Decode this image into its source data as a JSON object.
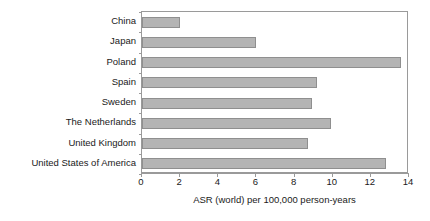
{
  "chart_data": {
    "type": "bar",
    "orientation": "horizontal",
    "title": "",
    "xlabel": "ASR (world) per 100,000 person-years",
    "ylabel": "",
    "categories": [
      "China",
      "Japan",
      "Poland",
      "Spain",
      "Sweden",
      "The Netherlands",
      "United Kingdom",
      "United States of America"
    ],
    "values": [
      2.0,
      6.0,
      13.6,
      9.2,
      8.9,
      9.9,
      8.7,
      12.8
    ],
    "xlim": [
      0,
      14
    ],
    "x_ticks": [
      0,
      2,
      4,
      6,
      8,
      10,
      12,
      14
    ],
    "x_tick_labels": [
      "0",
      "2",
      "4",
      "6",
      "8",
      "10",
      "12",
      "14"
    ],
    "grid": false,
    "legend": null,
    "bar_color": "#b4b4b4",
    "bar_border_color": "#8f8f8f",
    "axis_color": "#9a9a9a",
    "text_color": "#1a1a1a"
  }
}
